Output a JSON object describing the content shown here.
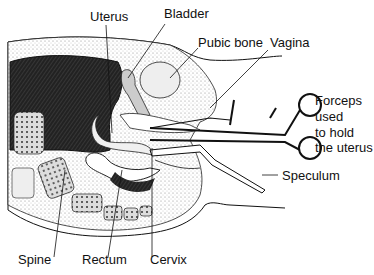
{
  "diagram": {
    "type": "anatomical cross-section",
    "labels": {
      "uterus": "Uterus",
      "bladder": "Bladder",
      "pubic_bone": "Pubic bone",
      "vagina": "Vagina",
      "forceps": [
        "Forceps",
        "used",
        "to hold",
        "the uterus"
      ],
      "speculum": "Speculum",
      "spine": "Spine",
      "rectum": "Rectum",
      "cervix": "Cervix"
    }
  }
}
